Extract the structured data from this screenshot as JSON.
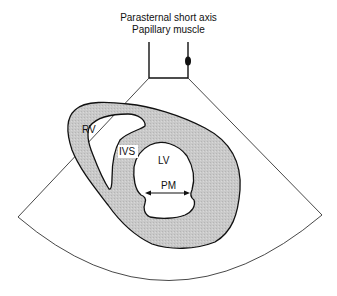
{
  "diagram": {
    "title_line1": "Parasternal short axis",
    "title_line2": "Papillary muscle",
    "labels": {
      "rv": "RV",
      "ivs": "IVS",
      "lv": "LV",
      "pm": "PM"
    },
    "colors": {
      "myocardium_fill": "#c8c8c8",
      "outline": "#111111",
      "background": "#ffffff"
    }
  }
}
